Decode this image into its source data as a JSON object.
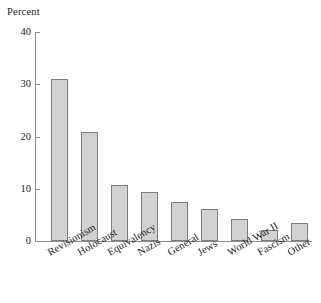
{
  "chart_data": {
    "type": "bar",
    "title": "",
    "subtitle": "",
    "xlabel": "",
    "ylabel": "Percent",
    "ylim": [
      0,
      40
    ],
    "yticks": [
      0,
      10,
      20,
      30,
      40
    ],
    "ytick_labels": [
      "0",
      "10",
      "20",
      "30",
      "40"
    ],
    "grid": false,
    "legend": null,
    "orientation": "vertical",
    "bar_color": "#d2d2d2",
    "bar_edge_color": "#7e7e7e",
    "axis_color": "#8d8d8d",
    "x_label_rotation_deg": -30,
    "categories": [
      "Revisionism",
      "Holocaust",
      "Equivalency",
      "Nazis",
      "General",
      "Jews",
      "World War II",
      "Fascism",
      "Other"
    ],
    "values": [
      31.0,
      20.8,
      10.7,
      9.3,
      7.4,
      6.1,
      4.3,
      2.2,
      3.5
    ]
  },
  "axis": {
    "y_title": "Percent"
  }
}
